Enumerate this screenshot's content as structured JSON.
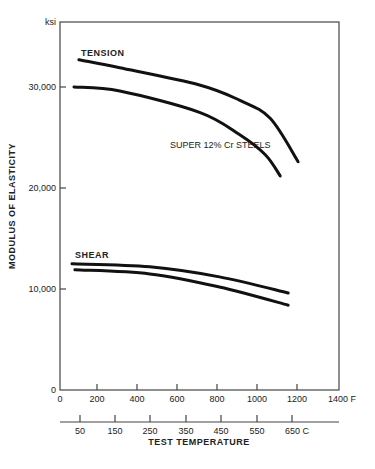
{
  "chart_data": {
    "type": "line",
    "title": "",
    "annotation": "SUPER 12% Cr STEELS",
    "xlabel": "TEST TEMPERATURE",
    "ylabel": "MODULUS OF ELASTICITY",
    "y_unit": "ksi",
    "xlim": [
      0,
      1400
    ],
    "ylim": [
      0,
      32000
    ],
    "x_unit_primary": "F",
    "x_unit_secondary": "C",
    "x_ticks_F": [
      "0",
      "200",
      "400",
      "600",
      "800",
      "1000",
      "1200",
      "1400 F"
    ],
    "x_ticks_C": [
      "50",
      "150",
      "250",
      "350",
      "450",
      "550",
      "650 C"
    ],
    "y_ticks": [
      "0",
      "10,000",
      "20,000",
      "30,000"
    ],
    "grid": false,
    "series": [
      {
        "name": "TENSION (upper)",
        "group": "TENSION",
        "x": [
          95,
          300,
          700,
          900,
          1055,
          1195
        ],
        "values": [
          32700,
          31900,
          30200,
          28700,
          26900,
          22600
        ]
      },
      {
        "name": "TENSION (lower)",
        "group": "TENSION",
        "x": [
          70,
          300,
          700,
          900,
          1030,
          1105
        ],
        "values": [
          30000,
          29600,
          27500,
          25300,
          23300,
          21200
        ]
      },
      {
        "name": "SHEAR (upper)",
        "group": "SHEAR",
        "x": [
          60,
          450,
          800,
          1145
        ],
        "values": [
          12500,
          12200,
          11200,
          9600
        ]
      },
      {
        "name": "SHEAR (lower)",
        "group": "SHEAR",
        "x": [
          75,
          450,
          800,
          1145
        ],
        "values": [
          11900,
          11500,
          10200,
          8400
        ]
      }
    ],
    "curve_labels": [
      "TENSION",
      "SHEAR"
    ]
  },
  "labels": {
    "unit": "ksi",
    "ylabel": "MODULUS OF ELASTICITY",
    "xlabel": "TEST TEMPERATURE",
    "annotation": "SUPER 12% Cr STEELS",
    "tension": "TENSION",
    "shear": "SHEAR",
    "y0": "0",
    "y10": "10,000",
    "y20": "20,000",
    "y30": "30,000",
    "f0": "0",
    "f200": "200",
    "f400": "400",
    "f600": "600",
    "f800": "800",
    "f1000": "1000",
    "f1200": "1200",
    "f1400": "1400 F",
    "c50": "50",
    "c150": "150",
    "c250": "250",
    "c350": "350",
    "c450": "450",
    "c550": "550",
    "c650": "650 C"
  }
}
